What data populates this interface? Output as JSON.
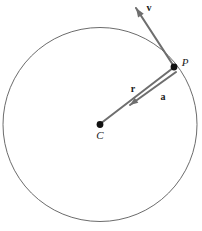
{
  "figure": {
    "background_color": "#ffffff",
    "width": 202,
    "height": 231
  },
  "colors": {
    "circle_stroke": "#5a5a5a",
    "vector_stroke": "#6e6e6e",
    "point_fill": "#111111",
    "label_text": "#1a1a1a"
  },
  "circle": {
    "name": "trajectory-circle",
    "center_x": 100,
    "center_y": 124.5,
    "radius": 97,
    "stroke_width": 0.9
  },
  "points": [
    {
      "id": "center",
      "label": "C",
      "x": 100,
      "y": 124.5,
      "dot_radius": 3.4,
      "label_x": 100,
      "label_y": 139
    },
    {
      "id": "particle",
      "label": "P",
      "x": 174,
      "y": 67,
      "dot_radius": 3.4,
      "label_x": 185,
      "label_y": 66
    }
  ],
  "vectors": [
    {
      "id": "velocity",
      "label": "v",
      "description": "velocity vector, tangent to the circle at P, pointing up and to the left",
      "tail_x": 175,
      "tail_y": 68,
      "head_x": 136,
      "head_y": 8,
      "stroke_width": 2.1,
      "arrowhead": true,
      "label_x": 149,
      "label_y": 11
    },
    {
      "id": "radius",
      "label": "r",
      "description": "position vector r drawn from center C to point P",
      "tail_x": 100,
      "tail_y": 124,
      "head_x": 173,
      "head_y": 68,
      "stroke_width": 2.0,
      "arrowhead": false,
      "label_x": 133,
      "label_y": 92
    },
    {
      "id": "acceleration",
      "label": "a",
      "description": "centripetal acceleration vector, from P pointing inward toward C",
      "tail_x": 176,
      "tail_y": 72,
      "head_x": 130,
      "head_y": 105,
      "stroke_width": 2.1,
      "arrowhead": true,
      "label_x": 163,
      "label_y": 100
    }
  ]
}
